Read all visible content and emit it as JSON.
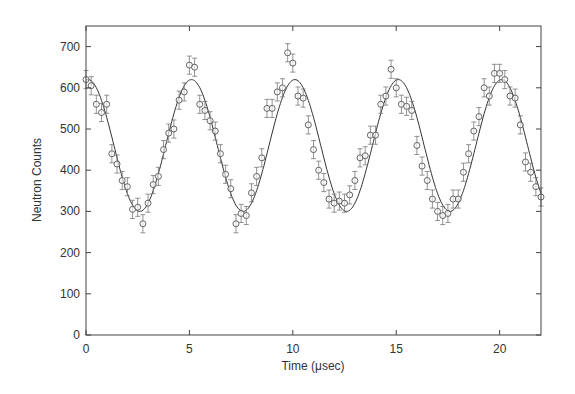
{
  "chart_data": {
    "type": "scatter",
    "title": "",
    "xlabel": "Time (μsec)",
    "ylabel": "Neutron Counts",
    "xlim": [
      0,
      22
    ],
    "ylim": [
      0,
      750
    ],
    "xticks": [
      0,
      5,
      10,
      15,
      20
    ],
    "yticks": [
      0,
      100,
      200,
      300,
      400,
      500,
      600,
      700
    ],
    "grid": false,
    "legend": null,
    "fit": {
      "type": "sinusoid",
      "offset": 460,
      "amplitude": 160,
      "period": 5.0,
      "peak_at": 0.1
    },
    "series": [
      {
        "name": "data",
        "marker": "open-circle",
        "error_bars": true,
        "x": [
          0.0,
          0.25,
          0.5,
          0.75,
          1.0,
          1.25,
          1.5,
          1.75,
          2.0,
          2.25,
          2.5,
          2.75,
          3.0,
          3.25,
          3.5,
          3.75,
          4.0,
          4.25,
          4.5,
          4.75,
          5.0,
          5.25,
          5.5,
          5.75,
          6.0,
          6.25,
          6.5,
          6.75,
          7.0,
          7.25,
          7.5,
          7.75,
          8.0,
          8.25,
          8.5,
          8.75,
          9.0,
          9.25,
          9.5,
          9.75,
          10.0,
          10.25,
          10.5,
          10.75,
          11.0,
          11.25,
          11.5,
          11.75,
          12.0,
          12.25,
          12.5,
          12.75,
          13.0,
          13.25,
          13.5,
          13.75,
          14.0,
          14.25,
          14.5,
          14.75,
          15.0,
          15.25,
          15.5,
          15.75,
          16.0,
          16.25,
          16.5,
          16.75,
          17.0,
          17.25,
          17.5,
          17.75,
          18.0,
          18.25,
          18.5,
          18.75,
          19.0,
          19.25,
          19.5,
          19.75,
          20.0,
          20.25,
          20.5,
          20.75,
          21.0,
          21.25,
          21.5,
          21.75,
          22.0
        ],
        "y": [
          620,
          605,
          560,
          540,
          560,
          440,
          415,
          375,
          360,
          305,
          310,
          270,
          320,
          365,
          385,
          450,
          490,
          500,
          570,
          590,
          655,
          650,
          560,
          545,
          520,
          495,
          440,
          390,
          355,
          270,
          295,
          290,
          345,
          385,
          430,
          550,
          550,
          590,
          600,
          685,
          660,
          580,
          575,
          510,
          450,
          400,
          370,
          330,
          320,
          325,
          320,
          340,
          375,
          430,
          435,
          485,
          485,
          560,
          580,
          645,
          600,
          560,
          555,
          545,
          460,
          410,
          375,
          330,
          300,
          290,
          295,
          330,
          330,
          395,
          440,
          495,
          530,
          600,
          580,
          635,
          635,
          620,
          580,
          575,
          510,
          420,
          395,
          360,
          335
        ],
        "yerr": 22
      }
    ]
  }
}
